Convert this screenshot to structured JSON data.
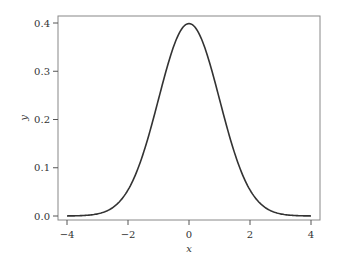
{
  "chart_data": {
    "type": "line",
    "title": "",
    "xlabel": "x",
    "ylabel": "y",
    "xlim": [
      -4.15,
      4.15
    ],
    "ylim": [
      -0.015,
      0.42
    ],
    "grid": false,
    "legend": null,
    "xticks": [
      -4,
      -2,
      0,
      2,
      4
    ],
    "xtick_labels": [
      "−4",
      "−2",
      "0",
      "2",
      "4"
    ],
    "yticks": [
      0.0,
      0.1,
      0.2,
      0.3,
      0.4
    ],
    "ytick_labels": [
      "0.0",
      "0.1",
      "0.2",
      "0.3",
      "0.4"
    ],
    "series": [
      {
        "name": "standard normal pdf",
        "function": "exp(-x^2/2)/sqrt(2*pi)",
        "x": [
          -4,
          -3.5,
          -3,
          -2.5,
          -2,
          -1.5,
          -1,
          -0.5,
          0,
          0.5,
          1,
          1.5,
          2,
          2.5,
          3,
          3.5,
          4
        ],
        "y": [
          0.0001,
          0.0009,
          0.0044,
          0.0175,
          0.054,
          0.1295,
          0.242,
          0.3521,
          0.3989,
          0.3521,
          0.242,
          0.1295,
          0.054,
          0.0175,
          0.0044,
          0.0009,
          0.0001
        ],
        "color": "#333333"
      }
    ]
  },
  "colors": {
    "frame": "#888888",
    "line": "#333333",
    "text": "#333333",
    "background": "#ffffff"
  }
}
